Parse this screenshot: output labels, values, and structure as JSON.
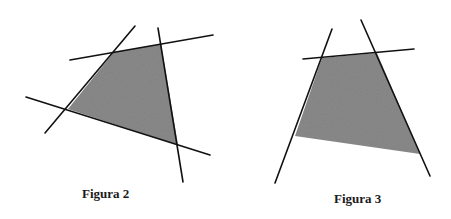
{
  "figures": [
    {
      "id": "figura-2",
      "caption": "Figura 2",
      "description": "Quadrilateral shaded region bounded by four intersecting lines",
      "line_count": 4,
      "shaded": true
    },
    {
      "id": "figura-3",
      "caption": "Figura 3",
      "description": "Unbounded shaded region bounded by three lines, open at the bottom",
      "line_count": 3,
      "shaded": true
    }
  ],
  "colors": {
    "fill": "#8a8a8a",
    "line": "#111111",
    "background": "#ffffff"
  }
}
